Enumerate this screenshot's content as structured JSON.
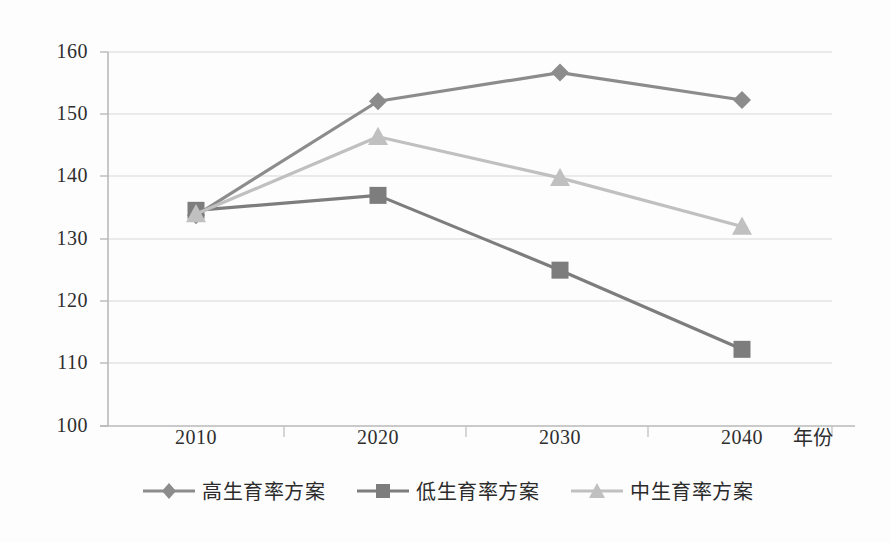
{
  "chart_data": {
    "type": "line",
    "title": "",
    "xlabel": "年份",
    "ylabel": "",
    "categories": [
      "2010",
      "2020",
      "2030",
      "2040"
    ],
    "ylim": [
      100,
      160
    ],
    "yticks": [
      "100",
      "110",
      "120",
      "130",
      "140",
      "150",
      "160"
    ],
    "grid": true,
    "legend_position": "bottom",
    "series": [
      {
        "name": "高生育率方案",
        "marker": "diamond",
        "color": "#8c8c8c",
        "values": [
          133.8,
          152.1,
          156.7,
          152.3
        ]
      },
      {
        "name": "低生育率方案",
        "marker": "square",
        "color": "#7d7d7d",
        "values": [
          134.6,
          137.0,
          125.0,
          112.3
        ]
      },
      {
        "name": "中生育率方案",
        "marker": "triangle",
        "color": "#c0c0c0",
        "values": [
          134.0,
          146.4,
          139.8,
          132.0
        ]
      }
    ]
  },
  "axis": {
    "y_tick_labels": [
      "160",
      "150",
      "140",
      "130",
      "120",
      "110",
      "100"
    ],
    "x_tick_labels": [
      "2010",
      "2020",
      "2030",
      "2040"
    ],
    "x_axis_title": "年份"
  },
  "legend": {
    "entries": [
      {
        "label": "高生育率方案",
        "marker": "diamond-marker-icon",
        "color": "#8c8c8c"
      },
      {
        "label": "低生育率方案",
        "marker": "square-marker-icon",
        "color": "#7d7d7d"
      },
      {
        "label": "中生育率方案",
        "marker": "triangle-marker-icon",
        "color": "#c0c0c0"
      }
    ]
  },
  "colors": {
    "grid": "#d9d9d9",
    "axis": "#bdbdbd",
    "background": "#fdfdfd",
    "text": "#2e2e2e"
  }
}
